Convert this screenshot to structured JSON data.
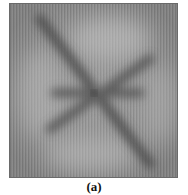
{
  "figure": {
    "caption": "(a)",
    "colors": {
      "background_gray": "#8a8a8a",
      "light_gray": "#a8a8a8",
      "dark_band": "#4a4a4a",
      "center": "#222222"
    }
  }
}
